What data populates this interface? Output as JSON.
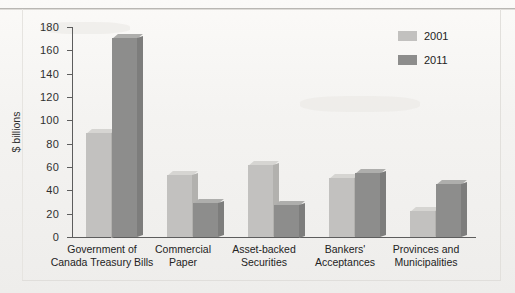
{
  "chart_data": {
    "type": "bar",
    "title": "",
    "xlabel": "",
    "ylabel": "$ billions",
    "ylim": [
      0,
      180
    ],
    "yticks": [
      0,
      20,
      40,
      60,
      80,
      100,
      120,
      140,
      160,
      180
    ],
    "grid": false,
    "legend_position": "top-right",
    "categories": [
      "Government of\nCanada Treasury Bills",
      "Commercial\nPaper",
      "Asset-backed\nSecurities",
      "Bankers'\nAcceptances",
      "Provinces and\nMunicipalities"
    ],
    "category_lines": [
      [
        "Government of",
        "Canada Treasury Bills"
      ],
      [
        "Commercial",
        "Paper"
      ],
      [
        "Asset-backed",
        "Securities"
      ],
      [
        "Bankers'",
        "Acceptances"
      ],
      [
        "Provinces and",
        "Municipalities"
      ]
    ],
    "series": [
      {
        "name": "2001",
        "color": "#c2c1bf",
        "values": [
          90,
          53,
          62,
          51,
          22
        ]
      },
      {
        "name": "2011",
        "color": "#8d8d8c",
        "values": [
          171,
          29,
          28,
          55,
          46
        ]
      }
    ]
  },
  "legend": {
    "items": [
      {
        "label": "2001",
        "swatch": "legend-swatch-2001"
      },
      {
        "label": "2011",
        "swatch": "legend-swatch-2011"
      }
    ]
  },
  "axis": {
    "y_title": "$ billions",
    "y_tick_labels": [
      "180",
      "160",
      "140",
      "120",
      "100",
      "80",
      "60",
      "40",
      "20",
      "0"
    ]
  },
  "colors": {
    "series_2001": "#c2c1bf",
    "series_2011": "#8d8d8c",
    "axis": "#5d5d5d",
    "text": "#232323",
    "page_background": "#f4f3f1"
  }
}
